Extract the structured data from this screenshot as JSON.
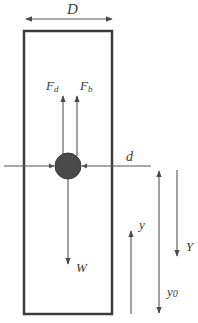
{
  "diagram": {
    "type": "free-body diagram of a sphere falling in a cylindrical tube",
    "colors": {
      "outline": "#3c3c3c",
      "line": "#555555",
      "ball": "#4a4a4a",
      "text": "#3a3a3a",
      "background": "#ffffff"
    },
    "labels": {
      "tube_diameter": "D",
      "drag_force_main": "F",
      "drag_force_sub": "d",
      "buoyancy_force_main": "F",
      "buoyancy_force_sub": "b",
      "sphere_diameter": "d",
      "weight": "W",
      "position_y": "y",
      "initial_position_main": "y",
      "initial_position_sub": "0",
      "displacement": "Y"
    }
  }
}
